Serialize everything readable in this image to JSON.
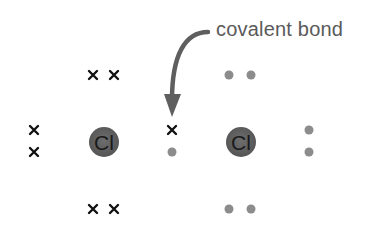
{
  "diagram": {
    "annotation": "covalent bond",
    "atoms": [
      {
        "symbol": "Cl",
        "cx": 104,
        "cy": 142
      },
      {
        "symbol": "Cl",
        "cx": 241,
        "cy": 142
      }
    ],
    "electron_marks": {
      "left_atom_crosses": 7,
      "right_atom_dots": 7,
      "shared_pair": [
        "x",
        "•"
      ]
    },
    "colors": {
      "nucleus": "#606060",
      "dot": "#8c8c8c",
      "cross": "#111111",
      "arrow": "#5f5f5f",
      "label": "#5a5a5a"
    }
  }
}
